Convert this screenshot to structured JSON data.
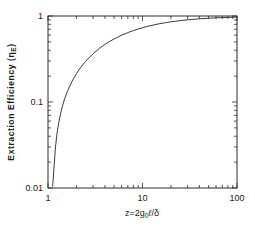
{
  "chart_data": {
    "type": "line",
    "title": "",
    "xlabel": "z=2g₀ℓ/δ",
    "ylabel": "Extraction Efficiency (ηₑ)",
    "xscale": "log",
    "yscale": "log",
    "xlim": [
      1,
      100
    ],
    "ylim": [
      0.01,
      1
    ],
    "xticks": [
      1,
      10,
      100
    ],
    "xtick_labels": [
      "1",
      "10",
      "100"
    ],
    "yticks": [
      0.01,
      0.1,
      1
    ],
    "ytick_labels": [
      "0.01",
      "0.1",
      "1"
    ],
    "grid": false,
    "legend": null,
    "minor_ticks": true,
    "series": [
      {
        "name": "extraction-efficiency",
        "color": "#3a3a3a",
        "x": [
          1.12,
          1.15,
          1.2,
          1.25,
          1.3,
          1.4,
          1.5,
          1.6,
          1.8,
          2.0,
          2.2,
          2.5,
          3.0,
          3.5,
          4.0,
          4.5,
          5.0,
          6.0,
          7.0,
          8.0,
          9.0,
          10.0,
          12.0,
          15.0,
          18.0,
          20.0,
          25.0,
          30.0,
          40.0,
          50.0,
          60.0,
          70.0,
          80.0,
          90.0,
          100.0
        ],
        "y": [
          0.0105,
          0.0158,
          0.0301,
          0.0444,
          0.058,
          0.0845,
          0.109,
          0.132,
          0.175,
          0.214,
          0.25,
          0.297,
          0.364,
          0.42,
          0.467,
          0.507,
          0.541,
          0.597,
          0.641,
          0.677,
          0.706,
          0.731,
          0.77,
          0.812,
          0.841,
          0.856,
          0.884,
          0.903,
          0.928,
          0.942,
          0.952,
          0.959,
          0.964,
          0.968,
          0.971
        ]
      }
    ]
  },
  "axis": {
    "y_label_main": "Extraction Efficiency",
    "y_label_symbol_open": "(",
    "y_label_eta": "η",
    "y_label_sub": "E",
    "y_label_symbol_close": ")",
    "x_label_z": "z=2g",
    "x_label_zero": "0",
    "x_label_l": "ℓ",
    "x_label_slash_delta": "/δ"
  },
  "colors": {
    "axis": "#2b2b2b",
    "curve": "#3a3a3a",
    "background": "#ffffff",
    "text": "#1a1a1a"
  }
}
